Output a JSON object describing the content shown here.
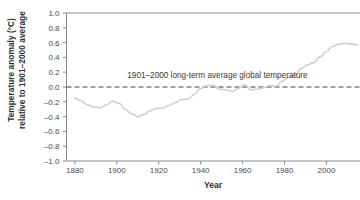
{
  "chart_data": {
    "type": "line",
    "title": "",
    "xlabel": "Year",
    "ylabel_line1": "Temperature anomaly (°C)",
    "ylabel_line2": "relative to 1901–2000 average",
    "xlim": [
      1876,
      2016
    ],
    "ylim": [
      -1.0,
      1.0
    ],
    "grid": false,
    "legend": "none",
    "x_ticks": [
      1880,
      1900,
      1920,
      1940,
      1960,
      1980,
      2000
    ],
    "x_tick_labels": [
      "1880",
      "1900",
      "1920",
      "1940",
      "1960",
      "1980",
      "2000"
    ],
    "y_ticks": [
      -1.0,
      -0.8,
      -0.6,
      -0.4,
      -0.2,
      0.0,
      0.2,
      0.4,
      0.6,
      0.8,
      1.0
    ],
    "y_tick_labels": [
      "–1.0",
      "–0.8",
      "–0.6",
      "–0.4",
      "–0.2",
      "0.0",
      "0.2",
      "0.4",
      "0.6",
      "0.8",
      "1.0"
    ],
    "annotations": [
      {
        "text": "1901–2000 long-term average global temperature",
        "x": 1948,
        "y": 0.12
      }
    ],
    "reference_line": {
      "value": 0.0,
      "style": "dashed",
      "color": "#3a3a3a"
    },
    "series": [
      {
        "name": "Global temperature anomaly",
        "color": "#cfcfcf",
        "x": [
          1880,
          1883,
          1886,
          1889,
          1892,
          1895,
          1898,
          1901,
          1904,
          1907,
          1910,
          1913,
          1916,
          1919,
          1922,
          1925,
          1928,
          1931,
          1934,
          1937,
          1940,
          1943,
          1946,
          1949,
          1952,
          1955,
          1958,
          1961,
          1964,
          1967,
          1970,
          1973,
          1976,
          1979,
          1982,
          1985,
          1988,
          1991,
          1994,
          1997,
          2000,
          2003,
          2006,
          2009,
          2012,
          2015
        ],
        "values": [
          -0.15,
          -0.19,
          -0.24,
          -0.27,
          -0.28,
          -0.24,
          -0.19,
          -0.22,
          -0.3,
          -0.36,
          -0.4,
          -0.37,
          -0.32,
          -0.29,
          -0.28,
          -0.25,
          -0.21,
          -0.17,
          -0.16,
          -0.1,
          -0.02,
          0.02,
          0.02,
          -0.03,
          -0.04,
          -0.06,
          -0.02,
          0.03,
          -0.04,
          -0.03,
          -0.01,
          0.02,
          0.01,
          0.08,
          0.13,
          0.16,
          0.25,
          0.3,
          0.33,
          0.41,
          0.48,
          0.55,
          0.58,
          0.59,
          0.58,
          0.57
        ]
      }
    ]
  }
}
